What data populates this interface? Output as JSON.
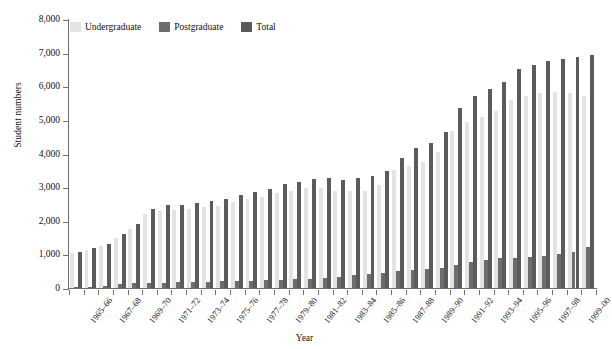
{
  "chart_data": {
    "type": "bar",
    "title": "",
    "xlabel": "Year",
    "ylabel": "Student numbers",
    "ylim": [
      0,
      8000
    ],
    "ytick_values": [
      0,
      1000,
      2000,
      3000,
      4000,
      5000,
      6000,
      7000,
      8000
    ],
    "ytick_labels": [
      "0",
      "1,000",
      "2,000",
      "3,000",
      "4,000",
      "5,000",
      "6,000",
      "7,000",
      "8,000"
    ],
    "grid": false,
    "legend_position": "top-left",
    "categories": [
      "1965–66",
      "1966–67",
      "1967–68",
      "1968–69",
      "1969–70",
      "1970–71",
      "1971–72",
      "1972–73",
      "1973–74",
      "1974–75",
      "1975–76",
      "1976–77",
      "1977–78",
      "1978–79",
      "1979–80",
      "1980–81",
      "1981–82",
      "1982–83",
      "1983–84",
      "1984–85",
      "1985–86",
      "1986–87",
      "1987–88",
      "1988–89",
      "1989–90",
      "1990–91",
      "1991–92",
      "1992–93",
      "1993–94",
      "1994–95",
      "1995–96",
      "1996–97",
      "1997–98",
      "1998–99",
      "1999–00",
      "2000–01"
    ],
    "tick_labels_shown": [
      "1965–66",
      "1967–68",
      "1969–70",
      "1971–72",
      "1973–74",
      "1975–76",
      "1977–78",
      "1979–80",
      "1981–82",
      "1983–84",
      "1985–86",
      "1987–88",
      "1989–90",
      "1991–92",
      "1993–94",
      "1995–96",
      "1997–98",
      "1999–00"
    ],
    "series": [
      {
        "name": "Undergraduate",
        "color": "#e3e3e1",
        "values": [
          1050,
          1140,
          1250,
          1500,
          1750,
          2200,
          2300,
          2310,
          2350,
          2400,
          2450,
          2560,
          2640,
          2700,
          2840,
          2900,
          2960,
          2960,
          2880,
          2880,
          2900,
          3050,
          3500,
          3620,
          3760,
          4050,
          4680,
          4950,
          5100,
          5250,
          5600,
          5700,
          5800,
          5820,
          5800,
          5700
        ]
      },
      {
        "name": "Postgraduate",
        "color": "#6d6d6d",
        "values": [
          30,
          40,
          60,
          120,
          140,
          150,
          160,
          170,
          180,
          190,
          200,
          210,
          220,
          230,
          250,
          260,
          280,
          300,
          320,
          380,
          420,
          440,
          500,
          540,
          560,
          600,
          680,
          760,
          820,
          880,
          900,
          920,
          960,
          1000,
          1080,
          1220
        ]
      },
      {
        "name": "Total",
        "color": "#5b5b5b",
        "values": [
          1080,
          1180,
          1310,
          1620,
          1890,
          2350,
          2460,
          2480,
          2530,
          2590,
          2650,
          2770,
          2860,
          2930,
          3090,
          3160,
          3240,
          3260,
          3200,
          3260,
          3320,
          3490,
          3880,
          4160,
          4320,
          4650,
          5360,
          5710,
          5920,
          6130,
          6500,
          6620,
          6760,
          6820,
          6880,
          6920
        ]
      }
    ]
  },
  "legend": {
    "items": [
      {
        "label": "Undergraduate",
        "color": "#e3e3e1"
      },
      {
        "label": "Postgraduate",
        "color": "#6d6d6d"
      },
      {
        "label": "Total",
        "color": "#5b5b5b"
      }
    ]
  },
  "axes": {
    "x_title": "Year",
    "y_title": "Student numbers"
  }
}
